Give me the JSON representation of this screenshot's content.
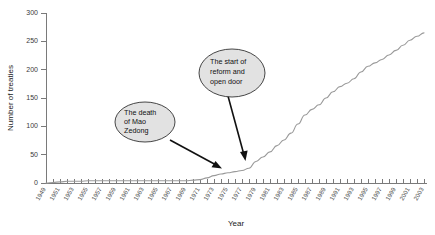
{
  "chart_data": {
    "type": "line",
    "title": "",
    "xlabel": "Year",
    "ylabel": "Number of treaties",
    "xlim": [
      1949,
      2003
    ],
    "ylim": [
      0,
      300
    ],
    "grid": false,
    "legend": false,
    "ytick_labels": [
      "0",
      "50",
      "100",
      "150",
      "200",
      "250",
      "300"
    ],
    "ytick_values": [
      0,
      50,
      100,
      150,
      200,
      250,
      300
    ],
    "xtick_labels": [
      "1949",
      "1951",
      "1953",
      "1955",
      "1957",
      "1959",
      "1961",
      "1963",
      "1965",
      "1967",
      "1969",
      "1971",
      "1973",
      "1975",
      "1977",
      "1979",
      "1981",
      "1983",
      "1985",
      "1987",
      "1989",
      "1991",
      "1993",
      "1995",
      "1997",
      "1999",
      "2001",
      "2003"
    ],
    "x": [
      1949,
      1950,
      1951,
      1952,
      1953,
      1954,
      1955,
      1956,
      1957,
      1958,
      1959,
      1960,
      1961,
      1962,
      1963,
      1964,
      1965,
      1966,
      1967,
      1968,
      1969,
      1970,
      1971,
      1972,
      1973,
      1974,
      1975,
      1976,
      1977,
      1978,
      1979,
      1980,
      1981,
      1982,
      1983,
      1984,
      1985,
      1986,
      1987,
      1988,
      1989,
      1990,
      1991,
      1992,
      1993,
      1994,
      1995,
      1996,
      1997,
      1998,
      1999,
      2000,
      2001,
      2002,
      2003
    ],
    "values": [
      0,
      1,
      2,
      3,
      3,
      3,
      4,
      4,
      4,
      4,
      4,
      4,
      4,
      4,
      4,
      4,
      4,
      4,
      4,
      4,
      4,
      5,
      6,
      9,
      13,
      16,
      18,
      20,
      22,
      26,
      38,
      46,
      55,
      66,
      76,
      88,
      104,
      120,
      130,
      138,
      150,
      161,
      170,
      176,
      184,
      196,
      206,
      212,
      218,
      226,
      234,
      243,
      252,
      259,
      265
    ],
    "series_name": "Number of treaties",
    "line_color": "#9a9a9a",
    "annotations": [
      {
        "id": "mao-death",
        "text_lines": [
          "The death",
          "of Mao",
          "Zedong"
        ],
        "target_year": 1976,
        "target_value": 20
      },
      {
        "id": "reform-open-door",
        "text_lines": [
          "The start of",
          "reform and",
          "open door"
        ],
        "target_year": 1979,
        "target_value": 38
      }
    ]
  }
}
